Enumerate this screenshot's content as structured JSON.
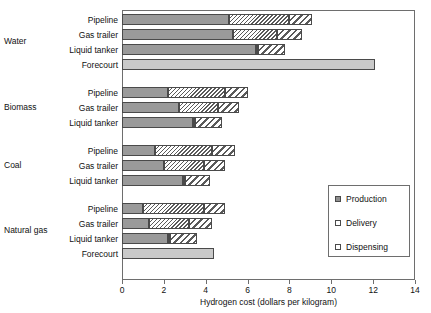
{
  "chart_data": {
    "type": "bar",
    "orientation": "horizontal",
    "stacked": true,
    "title": "",
    "xlabel": "Hydrogen cost (dollars per kilogram)",
    "ylabel": "",
    "xlim": [
      0,
      14
    ],
    "xticks": [
      0,
      2,
      4,
      6,
      8,
      10,
      12,
      14
    ],
    "xtick_labels": [
      "0",
      "2",
      "4",
      "6",
      "8",
      "10",
      "12",
      "14"
    ],
    "grid": false,
    "legend_position": "center-right",
    "legend_entries": [
      "Production",
      "Delivery",
      "Dispensing"
    ],
    "series": [
      {
        "name": "Production",
        "pattern": "solid-gray"
      },
      {
        "name": "Delivery",
        "pattern": "narrow-diagonal-hatch"
      },
      {
        "name": "Dispensing",
        "pattern": "wide-diagonal-hatch"
      }
    ],
    "groups": [
      {
        "name": "Water",
        "rows": [
          {
            "label": "Pipeline",
            "production": 5.1,
            "delivery": 2.9,
            "dispensing": 1.1,
            "total": 9.1
          },
          {
            "label": "Gas trailer",
            "production": 5.3,
            "delivery": 2.1,
            "dispensing": 1.2,
            "total": 8.6
          },
          {
            "label": "Liquid tanker",
            "production": 6.4,
            "delivery": 0.1,
            "dispensing": 1.3,
            "total": 7.8
          },
          {
            "label": "Forecourt",
            "combined": 12.1,
            "total": 12.1
          }
        ]
      },
      {
        "name": "Biomass",
        "rows": [
          {
            "label": "Pipeline",
            "production": 2.2,
            "delivery": 2.7,
            "dispensing": 1.1,
            "total": 6.0
          },
          {
            "label": "Gas trailer",
            "production": 2.7,
            "delivery": 1.9,
            "dispensing": 1.0,
            "total": 5.6
          },
          {
            "label": "Liquid tanker",
            "production": 3.4,
            "delivery": 0.1,
            "dispensing": 1.3,
            "total": 4.8
          }
        ]
      },
      {
        "name": "Coal",
        "rows": [
          {
            "label": "Pipeline",
            "production": 1.6,
            "delivery": 2.7,
            "dispensing": 1.1,
            "total": 5.4
          },
          {
            "label": "Gas trailer",
            "production": 2.0,
            "delivery": 1.9,
            "dispensing": 1.0,
            "total": 4.9
          },
          {
            "label": "Liquid tanker",
            "production": 2.9,
            "delivery": 0.1,
            "dispensing": 1.2,
            "total": 4.2
          }
        ]
      },
      {
        "name": "Natural gas",
        "rows": [
          {
            "label": "Pipeline",
            "production": 1.0,
            "delivery": 2.9,
            "dispensing": 1.0,
            "total": 4.9
          },
          {
            "label": "Gas trailer",
            "production": 1.3,
            "delivery": 1.9,
            "dispensing": 1.1,
            "total": 4.3
          },
          {
            "label": "Liquid tanker",
            "production": 2.2,
            "delivery": 0.1,
            "dispensing": 1.3,
            "total": 3.6
          },
          {
            "label": "Forecourt",
            "combined": 4.4,
            "total": 4.4
          }
        ]
      }
    ],
    "colors": {
      "production": "#9a9a9a",
      "delivery": "#ffffff",
      "dispensing": "#ffffff",
      "combined": "#c9c9c9",
      "outline": "#4a4a4a",
      "frame": "#6e6e6e",
      "text": "#111111"
    }
  }
}
